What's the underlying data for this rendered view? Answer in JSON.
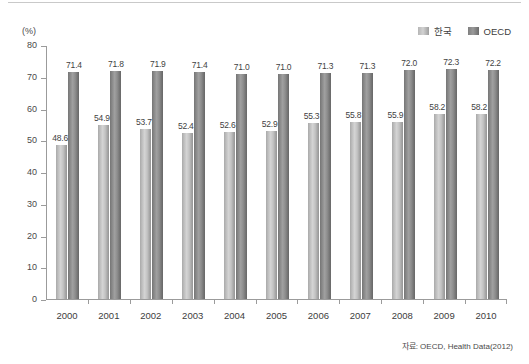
{
  "figure": {
    "unit_label": "(%)",
    "source_note": "자료: OECD, Health Data(2012)"
  },
  "legend": {
    "position": "top-right",
    "entries": [
      {
        "label": "한국",
        "color": "#c2c2c2"
      },
      {
        "label": "OECD",
        "color": "#828282"
      }
    ]
  },
  "axis": {
    "y_ticks": [
      "0",
      "10",
      "20",
      "30",
      "40",
      "50",
      "60",
      "70",
      "80"
    ],
    "y_min": 0,
    "y_max": 80
  },
  "chart_data": {
    "type": "bar",
    "title": "",
    "subtitle": "",
    "xlabel": "",
    "ylabel": "(%)",
    "ylim": [
      0,
      80
    ],
    "ytick_step": 10,
    "grid": false,
    "legend_position": "top-right",
    "categories": [
      "2000",
      "2001",
      "2002",
      "2003",
      "2004",
      "2005",
      "2006",
      "2007",
      "2008",
      "2009",
      "2010"
    ],
    "series": [
      {
        "name": "한국",
        "color": "#c2c2c2",
        "values": [
          48.6,
          54.9,
          53.7,
          52.4,
          52.6,
          52.9,
          55.3,
          55.8,
          55.9,
          58.2,
          58.2
        ],
        "labels": [
          "48.6",
          "54.9",
          "53.7",
          "52.4",
          "52.6",
          "52.9",
          "55.3",
          "55.8",
          "55.9",
          "58.2",
          "58.2"
        ]
      },
      {
        "name": "OECD",
        "color": "#828282",
        "values": [
          71.4,
          71.8,
          71.9,
          71.4,
          71.0,
          71.0,
          71.3,
          71.3,
          72.0,
          72.3,
          72.2
        ],
        "labels": [
          "71.4",
          "71.8",
          "71.9",
          "71.4",
          "71.0",
          "71.0",
          "71.3",
          "71.3",
          "72.0",
          "72.3",
          "72.2"
        ]
      }
    ],
    "annotations": [
      "자료: OECD, Health Data(2012)"
    ]
  }
}
